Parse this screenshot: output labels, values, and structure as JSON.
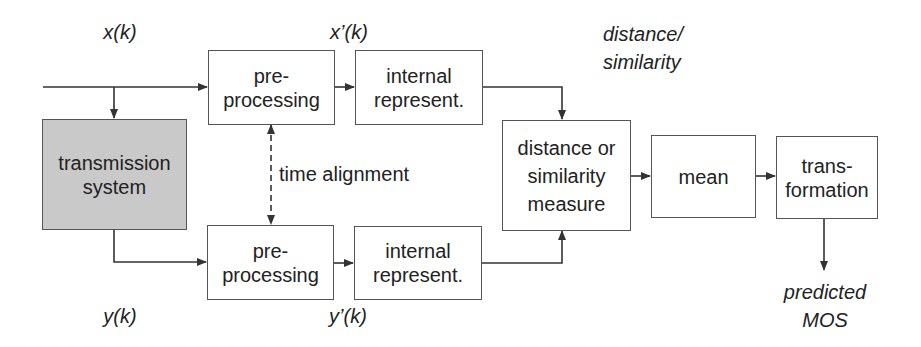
{
  "diagram": {
    "type": "block-diagram",
    "signals": {
      "input": "x(k)",
      "input_preprocessed": "x’(k)",
      "output": "y(k)",
      "output_preprocessed": "y’(k)",
      "distance_label_line1": "distance/",
      "distance_label_line2": "similarity",
      "result_line1": "predicted",
      "result_line2": "MOS"
    },
    "blocks": {
      "transmission": {
        "line1": "transmission",
        "line2": "system",
        "fill": "#c9c9c9"
      },
      "pre_top": {
        "line1": "pre-",
        "line2": "processing"
      },
      "internal_top": {
        "line1": "internal",
        "line2": "represent."
      },
      "pre_bottom": {
        "line1": "pre-",
        "line2": "processing"
      },
      "internal_bottom": {
        "line1": "internal",
        "line2": "represent."
      },
      "distance": {
        "line1": "distance or",
        "line2": "similarity",
        "line3": "measure"
      },
      "mean": {
        "line1": "mean"
      },
      "transformation": {
        "line1": "trans-",
        "line2": "formation"
      }
    },
    "annotations": {
      "time_alignment": "time alignment"
    },
    "colors": {
      "line": "#333333",
      "box_border": "#555555",
      "gray_fill": "#c9c9c9"
    }
  }
}
